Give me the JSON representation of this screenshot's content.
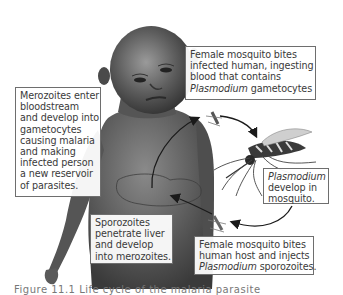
{
  "diagram": {
    "type": "malaria-life-cycle",
    "subjects": [
      "child-figure",
      "mosquito"
    ],
    "colors": {
      "box_border": "#6e6e6e",
      "box_bg": "#ffffff",
      "text": "#3a3a3a",
      "skin": "#5a5a5a",
      "arrow": "#1a1a1a"
    }
  },
  "labels": {
    "top_right": {
      "line1": "Female mosquito bites",
      "line2": "infected human, ingesting",
      "line3": "blood that contains",
      "line4_italic": "Plasmodium",
      "line4_rest": " gametocytes"
    },
    "left": {
      "lines": [
        "Merozoites enter",
        "bloodstream",
        "and develop into",
        "gametocytes",
        "causing malaria",
        "and making",
        "infected person",
        "a new reservoir",
        "of parasites."
      ]
    },
    "right_middle": {
      "line1_italic": "Plasmodium",
      "line2": "develop in",
      "line3": "mosquito."
    },
    "bottom_left": {
      "lines": [
        "Sporozoites",
        "penetrate liver",
        "and develop",
        "into merozoites."
      ]
    },
    "bottom_right": {
      "line1": "Female mosquito bites",
      "line2": "human host and injects",
      "line3_italic": "Plasmodium",
      "line3_rest": " sporozoites."
    }
  },
  "caption": {
    "text": "Figure 11.1  Life cycle of the malaria parasite"
  }
}
